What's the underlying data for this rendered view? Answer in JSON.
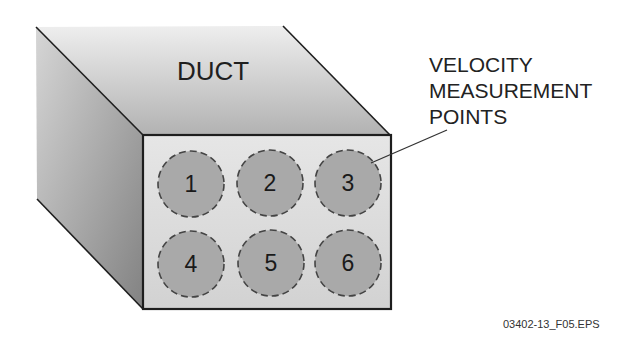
{
  "diagram": {
    "object_label": "DUCT",
    "callout": {
      "lines": [
        "VELOCITY",
        "MEASUREMENT",
        "POINTS"
      ],
      "points_to": "3"
    },
    "figure_id": "03402-13_F05.EPS",
    "measurement_points": [
      {
        "label": "1",
        "row": 1,
        "col": 1
      },
      {
        "label": "2",
        "row": 1,
        "col": 2
      },
      {
        "label": "3",
        "row": 1,
        "col": 3
      },
      {
        "label": "4",
        "row": 2,
        "col": 1
      },
      {
        "label": "5",
        "row": 2,
        "col": 2
      },
      {
        "label": "6",
        "row": 2,
        "col": 3
      }
    ],
    "colors": {
      "outline": "#1e1e1e",
      "front_face": "#dedede",
      "top_face_light": "#ececec",
      "top_face_dark": "#b4b4b4",
      "side_face_light": "#d4d4d4",
      "side_face_dark": "#858585",
      "point_fill": "#a9a9a9",
      "point_border": "#444444"
    }
  }
}
